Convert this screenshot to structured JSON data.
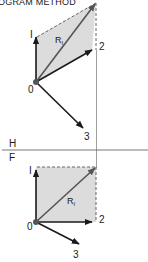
{
  "title": "OGRAM METHOD",
  "colors": {
    "vector": "#1a1a1a",
    "resultant": "#555555",
    "shade": "#d9d9d9",
    "construction": "#777777"
  },
  "views": {
    "horizontal": {
      "label": "H"
    },
    "frontal": {
      "label": "F"
    }
  },
  "upper_diagram": {
    "origin_label": "0",
    "vector_labels": {
      "v1": "I",
      "v2": "2",
      "v3": "3"
    },
    "resultant_label": "R",
    "resultant_subscript": "I"
  },
  "lower_diagram": {
    "origin_label": "0",
    "vector_labels": {
      "v1": "I",
      "v2": "2",
      "v3": "3"
    },
    "resultant_label": "R",
    "resultant_subscript": "I"
  }
}
